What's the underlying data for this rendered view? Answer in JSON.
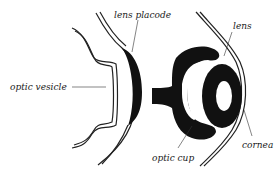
{
  "diagram": {
    "labels": {
      "lens_placode": "lens placode",
      "optic_vesicle": "optic vesicle",
      "lens": "lens",
      "optic_cup": "optic cup",
      "cornea": "cornea"
    },
    "colors": {
      "ink": "#1a1a1a",
      "background": "#ffffff"
    }
  }
}
